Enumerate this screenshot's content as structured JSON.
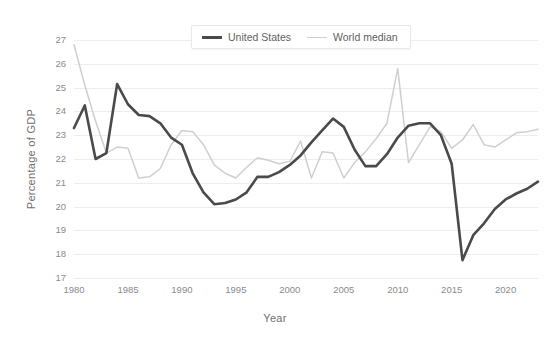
{
  "chart_data": {
    "type": "line",
    "title": "",
    "xlabel": "Year",
    "ylabel": "Percentage of GDP",
    "xlim": [
      1980,
      2023
    ],
    "ylim": [
      17,
      27
    ],
    "yticks": [
      17,
      18,
      19,
      20,
      21,
      22,
      23,
      24,
      25,
      26,
      27
    ],
    "xticks": [
      1980,
      1985,
      1990,
      1995,
      2000,
      2005,
      2010,
      2015,
      2020
    ],
    "grid": "horizontal",
    "legend_position": "top-center",
    "x": [
      1980,
      1981,
      1982,
      1983,
      1984,
      1985,
      1986,
      1987,
      1988,
      1989,
      1990,
      1991,
      1992,
      1993,
      1994,
      1995,
      1996,
      1997,
      1998,
      1999,
      2000,
      2001,
      2002,
      2003,
      2004,
      2005,
      2006,
      2007,
      2008,
      2009,
      2010,
      2011,
      2012,
      2013,
      2014,
      2015,
      2016,
      2017,
      2018,
      2019,
      2020,
      2021,
      2022,
      2023
    ],
    "series": [
      {
        "name": "United States",
        "color": "#4a4a4a",
        "width": 2.6,
        "values": [
          23.3,
          24.25,
          22.0,
          22.25,
          25.15,
          24.3,
          23.85,
          23.8,
          23.5,
          22.9,
          22.6,
          21.4,
          20.6,
          20.1,
          20.15,
          20.3,
          20.6,
          21.25,
          21.25,
          21.45,
          21.75,
          22.15,
          22.7,
          23.2,
          23.7,
          23.35,
          22.4,
          21.7,
          21.7,
          22.2,
          22.9,
          23.4,
          23.5,
          23.5,
          23.0,
          21.8,
          17.75,
          18.8,
          19.3,
          19.9,
          20.3,
          20.55,
          20.75,
          21.05
        ]
      },
      {
        "name": "World median",
        "color": "#cfcfcf",
        "width": 1.5,
        "values": [
          26.8,
          25.1,
          23.6,
          22.25,
          22.5,
          22.45,
          21.2,
          21.25,
          21.6,
          22.6,
          23.2,
          23.15,
          22.6,
          21.75,
          21.4,
          21.2,
          21.65,
          22.05,
          21.95,
          21.8,
          21.9,
          22.75,
          21.2,
          22.3,
          22.25,
          21.2,
          21.85,
          22.3,
          22.85,
          23.5,
          25.8,
          21.85,
          22.6,
          23.35,
          23.15,
          22.45,
          22.8,
          23.45,
          22.6,
          22.5,
          22.8,
          23.1,
          23.15,
          23.25
        ]
      }
    ],
    "legend": [
      {
        "label": "United States",
        "style": "thick-dark"
      },
      {
        "label": "World median",
        "style": "thin-light"
      }
    ]
  },
  "colors": {
    "us_line": "#4a4a4a",
    "world_line": "#cfcfcf",
    "gridline": "#ededed",
    "tick_text": "#8a8a8a",
    "axis_title": "#6f6f6f",
    "background": "#ffffff"
  }
}
